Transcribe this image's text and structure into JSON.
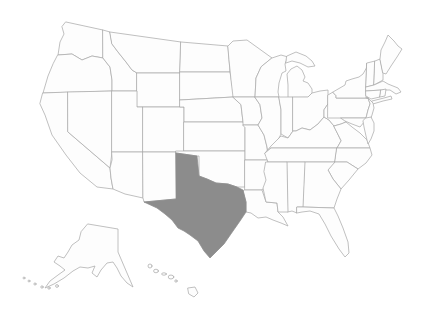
{
  "map": {
    "region": "United States",
    "highlighted_state": "Texas",
    "insets": [
      "Alaska",
      "Hawaii"
    ]
  },
  "colors": {
    "background": "#ffffff",
    "state_fill": "#fdfdfd",
    "state_border": "#ababab",
    "highlight": "#8c8c8c"
  }
}
